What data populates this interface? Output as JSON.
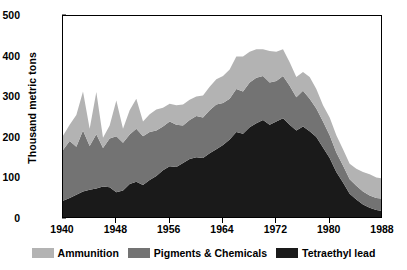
{
  "chart_data": {
    "type": "area",
    "stacked": true,
    "title": "",
    "xlabel": "",
    "ylabel": "Thousand metric tons",
    "xlim": [
      1940,
      1988
    ],
    "ylim": [
      0,
      500
    ],
    "yticks": [
      0,
      100,
      200,
      300,
      400,
      500
    ],
    "xticks": [
      1940,
      1948,
      1956,
      1964,
      1972,
      1980,
      1988
    ],
    "grid": false,
    "legend_position": "bottom",
    "x": [
      1940,
      1941,
      1942,
      1943,
      1944,
      1945,
      1946,
      1947,
      1948,
      1949,
      1950,
      1951,
      1952,
      1953,
      1954,
      1955,
      1956,
      1957,
      1958,
      1959,
      1960,
      1961,
      1962,
      1963,
      1964,
      1965,
      1966,
      1967,
      1968,
      1969,
      1970,
      1971,
      1972,
      1973,
      1974,
      1975,
      1976,
      1977,
      1978,
      1979,
      1980,
      1981,
      1982,
      1983,
      1984,
      1985,
      1986,
      1987,
      1988
    ],
    "series": [
      {
        "name": "Tetraethyl lead",
        "color": "#1a1a1a",
        "values": [
          45,
          52,
          60,
          68,
          72,
          75,
          80,
          78,
          66,
          70,
          86,
          92,
          84,
          96,
          106,
          120,
          130,
          128,
          138,
          148,
          152,
          150,
          162,
          172,
          182,
          196,
          214,
          210,
          226,
          236,
          244,
          232,
          240,
          248,
          232,
          218,
          228,
          216,
          202,
          176,
          150,
          116,
          90,
          62,
          48,
          36,
          28,
          22,
          20
        ]
      },
      {
        "name": "Pigments & Chemicals",
        "color": "#737373",
        "values": [
          125,
          140,
          118,
          150,
          108,
          134,
          95,
          120,
          138,
          118,
          122,
          130,
          120,
          118,
          112,
          108,
          110,
          104,
          92,
          96,
          102,
          100,
          106,
          110,
          104,
          100,
          106,
          104,
          110,
          112,
          108,
          104,
          100,
          104,
          96,
          82,
          88,
          80,
          70,
          64,
          56,
          48,
          42,
          36,
          34,
          32,
          30,
          30,
          30
        ]
      },
      {
        "name": "Ammunition",
        "color": "#b3b3b3",
        "values": [
          35,
          40,
          78,
          96,
          42,
          104,
          25,
          32,
          88,
          34,
          60,
          74,
          36,
          44,
          52,
          46,
          44,
          48,
          52,
          50,
          48,
          54,
          58,
          62,
          66,
          72,
          80,
          86,
          76,
          70,
          66,
          78,
          72,
          66,
          58,
          50,
          46,
          54,
          48,
          40,
          44,
          42,
          40,
          38,
          42,
          48,
          52,
          50,
          50
        ]
      }
    ]
  },
  "legend": {
    "items": [
      {
        "label": "Ammunition",
        "color": "#b3b3b3"
      },
      {
        "label": "Pigments & Chemicals",
        "color": "#737373"
      },
      {
        "label": "Tetraethyl lead",
        "color": "#1a1a1a"
      }
    ]
  },
  "axes": {
    "y_title": "Thousand metric tons",
    "y_tick_labels": [
      "0",
      "100",
      "200",
      "300",
      "400",
      "500"
    ],
    "x_tick_labels": [
      "1940",
      "1948",
      "1956",
      "1964",
      "1972",
      "1980",
      "1988"
    ]
  }
}
